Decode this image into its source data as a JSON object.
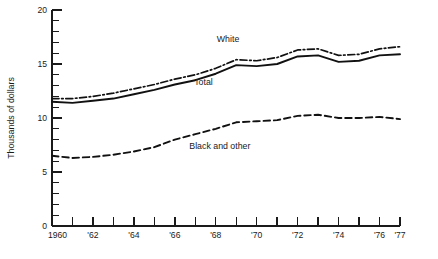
{
  "chart_data": {
    "type": "line",
    "title": "",
    "xlabel": "",
    "ylabel": "Thousands of dollars",
    "ylim": [
      0,
      20
    ],
    "xlim": [
      1960,
      1977
    ],
    "grid": false,
    "legend_position": "inline-annotations",
    "y_ticks_major": [
      "0",
      "5",
      "10",
      "15",
      "20"
    ],
    "y_tick_values_major": [
      0,
      5,
      10,
      15,
      20
    ],
    "y_minor_step": 1,
    "x_tick_values": [
      1960,
      1961,
      1962,
      1963,
      1964,
      1965,
      1966,
      1967,
      1968,
      1969,
      1970,
      1971,
      1972,
      1973,
      1974,
      1975,
      1976,
      1977
    ],
    "x_tick_labels": [
      "1960",
      "",
      "'62",
      "",
      "'64",
      "",
      "'66",
      "",
      "'68",
      "",
      "'70",
      "",
      "'72",
      "",
      "'74",
      "",
      "'76",
      "'77"
    ],
    "x": [
      1960,
      1961,
      1962,
      1963,
      1964,
      1965,
      1966,
      1967,
      1968,
      1969,
      1970,
      1971,
      1972,
      1973,
      1974,
      1975,
      1976,
      1977
    ],
    "series": [
      {
        "name": "Total",
        "style": "solid",
        "values": [
          11.5,
          11.4,
          11.6,
          11.8,
          12.2,
          12.6,
          13.1,
          13.5,
          14.1,
          14.9,
          14.8,
          15.0,
          15.7,
          15.8,
          15.2,
          15.3,
          15.8,
          15.9
        ]
      },
      {
        "name": "White",
        "style": "dash-dot",
        "values": [
          11.8,
          11.8,
          12.0,
          12.3,
          12.7,
          13.1,
          13.6,
          14.0,
          14.6,
          15.4,
          15.3,
          15.6,
          16.3,
          16.4,
          15.8,
          15.9,
          16.4,
          16.6
        ]
      },
      {
        "name": "Black and other",
        "style": "dashed",
        "values": [
          6.5,
          6.3,
          6.4,
          6.6,
          6.9,
          7.3,
          8.0,
          8.5,
          9.0,
          9.6,
          9.7,
          9.8,
          10.2,
          10.3,
          10.0,
          10.0,
          10.1,
          9.9
        ]
      }
    ],
    "annotations": [
      {
        "text": "White",
        "x": 1968.6,
        "y": 17.0
      },
      {
        "text": "Total",
        "x": 1967.4,
        "y": 13.1
      },
      {
        "text": "Black and other",
        "x": 1968.2,
        "y": 7.1
      }
    ]
  },
  "axis": {
    "y_title": "Thousands of dollars"
  }
}
